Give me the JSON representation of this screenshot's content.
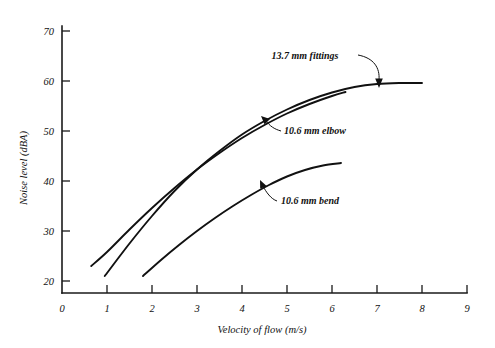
{
  "chart_data": {
    "type": "line",
    "title": "",
    "subtitle": "",
    "xlabel": "Velocity of flow (m/s)",
    "ylabel": "Noise level (dBA)",
    "xlim": [
      0,
      9
    ],
    "ylim": [
      18,
      74
    ],
    "xticks": [
      0,
      1,
      2,
      3,
      4,
      5,
      6,
      7,
      8,
      9
    ],
    "xtick_labels": [
      "0",
      "1",
      "2",
      "3",
      "4",
      "5",
      "6",
      "7",
      "8",
      "9"
    ],
    "yticks": [
      20,
      30,
      40,
      50,
      60,
      70
    ],
    "ytick_labels": [
      "20",
      "30",
      "40",
      "50",
      "60",
      "70"
    ],
    "grid": false,
    "legend_position": "none",
    "series": [
      {
        "name": "13.7 mm fittings",
        "x": [
          0.95,
          1.5,
          2.0,
          2.5,
          3.0,
          3.5,
          4.0,
          4.5,
          5.0,
          5.5,
          6.0,
          6.5,
          7.0,
          7.5,
          8.0
        ],
        "values": [
          21.0,
          27.5,
          33.0,
          38.0,
          42.3,
          46.0,
          49.3,
          52.0,
          54.3,
          56.2,
          57.7,
          58.8,
          59.4,
          59.6,
          59.6
        ]
      },
      {
        "name": "10.6 mm elbow",
        "x": [
          0.65,
          1.0,
          1.5,
          2.0,
          2.5,
          3.0,
          3.5,
          4.0,
          4.5,
          5.0,
          5.5,
          6.0,
          6.3
        ],
        "values": [
          23.0,
          25.8,
          30.3,
          34.6,
          38.6,
          42.3,
          45.6,
          48.6,
          51.2,
          53.5,
          55.4,
          57.0,
          57.8
        ]
      },
      {
        "name": "10.6 mm bend",
        "x": [
          1.8,
          2.2,
          2.6,
          3.0,
          3.4,
          3.8,
          4.2,
          4.6,
          5.0,
          5.4,
          5.8,
          6.2
        ],
        "values": [
          21.0,
          24.2,
          27.2,
          30.0,
          32.6,
          35.0,
          37.2,
          39.2,
          40.9,
          42.2,
          43.1,
          43.6
        ]
      }
    ],
    "annotations": [
      {
        "text": "13.7 mm fittings",
        "series": "13.7 mm fittings"
      },
      {
        "text": "10.6 mm elbow",
        "series": "10.6 mm elbow"
      },
      {
        "text": "10.6 mm bend",
        "series": "10.6 mm bend"
      }
    ]
  }
}
